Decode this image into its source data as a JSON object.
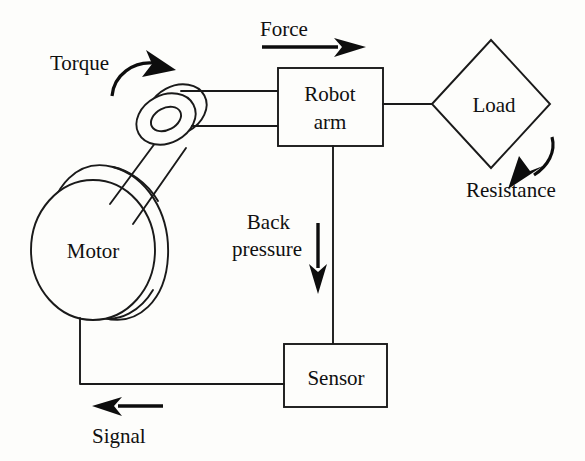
{
  "diagram": {
    "background_color": "#fdfdfb",
    "ink_color": "#1a1a1a",
    "nodes": [
      {
        "id": "motor",
        "label": "Motor",
        "shape": "cylinder"
      },
      {
        "id": "robot_arm",
        "label_line1": "Robot",
        "label_line2": "arm",
        "shape": "rectangle"
      },
      {
        "id": "load",
        "label": "Load",
        "shape": "diamond"
      },
      {
        "id": "sensor",
        "label": "Sensor",
        "shape": "rectangle"
      }
    ],
    "flow_labels": [
      {
        "id": "torque",
        "label": "Torque",
        "arrow": "curved-clockwise"
      },
      {
        "id": "force",
        "label": "Force",
        "arrow": "straight-right"
      },
      {
        "id": "resistance",
        "label": "Resistance",
        "arrow": "curved-down-left"
      },
      {
        "id": "back_pressure",
        "label_line1": "Back",
        "label_line2": "pressure",
        "arrow": "straight-down"
      },
      {
        "id": "signal",
        "label": "Signal",
        "arrow": "straight-left"
      }
    ]
  }
}
